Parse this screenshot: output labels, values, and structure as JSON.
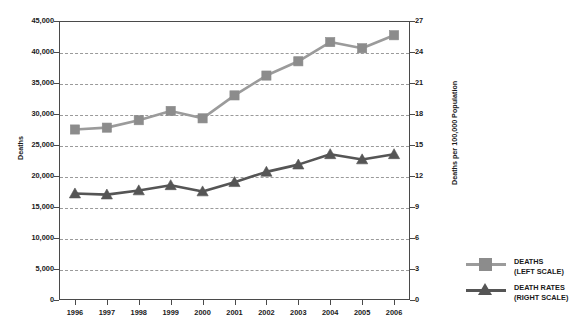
{
  "chart_data": {
    "type": "line",
    "title": "",
    "subtitle": "",
    "categories": [
      "1996",
      "1997",
      "1998",
      "1999",
      "2000",
      "2001",
      "2002",
      "2003",
      "2004",
      "2005",
      "2006"
    ],
    "xlabel": "",
    "grid": true,
    "legend_position": "right",
    "series": [
      {
        "name": "DEATHS\n(LEFT SCALE)",
        "axis": "left",
        "marker": "square",
        "color": "#8c8c8c",
        "line_color": "#9b9b9b",
        "values": [
          27500,
          27800,
          29000,
          30500,
          29300,
          33000,
          36200,
          38500,
          41600,
          40600,
          42700
        ]
      },
      {
        "name": "DEATH RATES\n(RIGHT SCALE)",
        "axis": "right",
        "marker": "triangle",
        "color": "#555555",
        "line_color": "#555555",
        "values": [
          10.3,
          10.2,
          10.6,
          11.1,
          10.5,
          11.4,
          12.4,
          13.1,
          14.1,
          13.6,
          14.1
        ]
      }
    ],
    "y_left": {
      "label": "Deaths",
      "ylim": [
        0,
        45000
      ],
      "ticks": [
        0,
        5000,
        10000,
        15000,
        20000,
        25000,
        30000,
        35000,
        40000,
        45000
      ],
      "tick_labels": [
        "0",
        "5,000",
        "10,000",
        "15,000",
        "20,000",
        "25,000",
        "30,000",
        "35,000",
        "40,000",
        "45,000"
      ]
    },
    "y_right": {
      "label": "Deaths per 100,000 Population",
      "ylim": [
        0,
        27
      ],
      "ticks": [
        0,
        3,
        6,
        9,
        12,
        15,
        18,
        21,
        24,
        27
      ],
      "tick_labels": [
        "0",
        "3",
        "6",
        "9",
        "12",
        "15",
        "18",
        "21",
        "24",
        "27"
      ]
    }
  },
  "legend": {
    "items": [
      {
        "label": "DEATHS\n(LEFT SCALE)",
        "marker": "square"
      },
      {
        "label": "DEATH RATES\n(RIGHT SCALE)",
        "marker": "triangle"
      }
    ]
  }
}
